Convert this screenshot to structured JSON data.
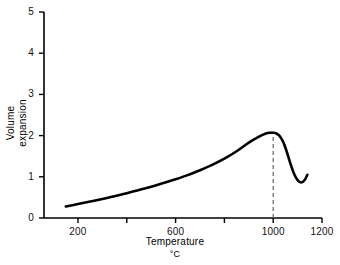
{
  "chart_data": {
    "type": "line",
    "title": "",
    "xlabel": "Temperature",
    "xlabel_units": "°C",
    "ylabel_line1": "Volume",
    "ylabel_line2": "expansion",
    "xlim": [
      100,
      1200
    ],
    "ylim": [
      0,
      5
    ],
    "xticks": [
      200,
      400,
      600,
      800,
      1000,
      1200
    ],
    "xtick_labels": [
      "200",
      "",
      "600",
      "",
      "1000",
      "1200"
    ],
    "yticks": [
      0,
      1,
      2,
      3,
      4,
      5
    ],
    "ytick_labels": [
      "0",
      "1",
      "2",
      "3",
      "4",
      "5"
    ],
    "grid": false,
    "legend": false,
    "line_color": "#000000",
    "line_width": 2.6,
    "series": [
      {
        "name": "volume expansion",
        "x": [
          150,
          200,
          250,
          300,
          350,
          400,
          450,
          500,
          550,
          600,
          650,
          700,
          750,
          800,
          850,
          900,
          940,
          970,
          990,
          1000,
          1010,
          1025,
          1040,
          1055,
          1070,
          1085,
          1100,
          1115,
          1130,
          1140
        ],
        "y": [
          0.28,
          0.34,
          0.4,
          0.46,
          0.53,
          0.6,
          0.68,
          0.76,
          0.85,
          0.94,
          1.04,
          1.16,
          1.29,
          1.44,
          1.62,
          1.83,
          1.97,
          2.05,
          2.07,
          2.07,
          2.06,
          2.0,
          1.86,
          1.62,
          1.33,
          1.08,
          0.92,
          0.86,
          0.93,
          1.05
        ]
      }
    ],
    "annotations": [
      {
        "name": "peak-marker",
        "type": "vertical-dashed-line",
        "x": 1000,
        "y_from": 0,
        "y_to": 2.07,
        "color": "#666666",
        "label": ""
      }
    ],
    "peak": {
      "x": 1000,
      "y": 2.07
    },
    "minimum_after_peak": {
      "x": 1115,
      "y": 0.86
    },
    "start_point": {
      "x": 150,
      "y": 0.28
    },
    "end_point": {
      "x": 1140,
      "y": 1.05
    }
  }
}
